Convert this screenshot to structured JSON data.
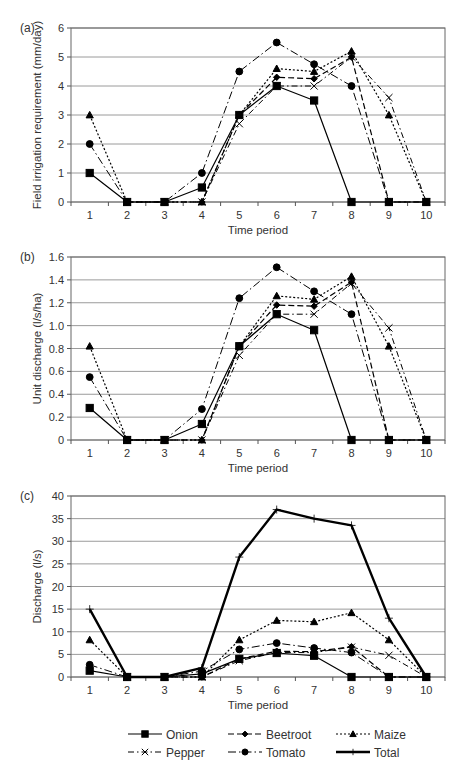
{
  "series_styles": {
    "Onion": {
      "marker": "square",
      "dash": "",
      "width": 1.2
    },
    "Beetroot": {
      "marker": "diamond",
      "dash": "6,3",
      "width": 1.2
    },
    "Maize": {
      "marker": "triangle",
      "dash": "2,2",
      "width": 1.2
    },
    "Pepper": {
      "marker": "x",
      "dash": "6,3,1.5,3",
      "width": 1.0
    },
    "Tomato": {
      "marker": "circle",
      "dash": "8,3,1.5,3",
      "width": 1.0
    },
    "Total": {
      "marker": "plus",
      "dash": "",
      "width": 2.4
    }
  },
  "legend": {
    "items": [
      "Onion",
      "Beetroot",
      "Maize",
      "Pepper",
      "Tomato",
      "Total"
    ]
  },
  "chart_data": [
    {
      "panel_label": "(a)",
      "type": "line",
      "title": "",
      "xlabel": "Time period",
      "ylabel": "Field irrigation requirement (mm/day)",
      "categories": [
        1,
        2,
        3,
        4,
        5,
        6,
        7,
        8,
        9,
        10
      ],
      "ylim": [
        0,
        6
      ],
      "yticks": [
        0,
        1,
        2,
        3,
        4,
        5,
        6
      ],
      "ytick_labels": [
        "0",
        "1",
        "2",
        "3",
        "4",
        "5",
        "6"
      ],
      "grid": true,
      "series": [
        {
          "name": "Onion",
          "values": [
            1.0,
            0,
            0,
            0.5,
            3.0,
            4.0,
            3.5,
            0,
            0,
            0
          ]
        },
        {
          "name": "Beetroot",
          "values": [
            null,
            0,
            0,
            0,
            3.0,
            4.3,
            4.25,
            5.0,
            0,
            0
          ]
        },
        {
          "name": "Maize",
          "values": [
            3.0,
            0,
            0,
            0,
            3.0,
            4.6,
            4.5,
            5.2,
            3.0,
            0
          ]
        },
        {
          "name": "Pepper",
          "values": [
            null,
            0,
            0,
            0,
            2.7,
            4.0,
            4.0,
            5.0,
            3.6,
            0
          ]
        },
        {
          "name": "Tomato",
          "values": [
            2.0,
            0,
            0,
            1.0,
            4.5,
            5.5,
            4.75,
            4.0,
            0,
            0
          ]
        }
      ],
      "frame": {
        "left": 71,
        "top": 28,
        "right": 445,
        "bottom": 202
      }
    },
    {
      "panel_label": "(b)",
      "type": "line",
      "title": "",
      "xlabel": "Time period",
      "ylabel": "Unit discharge (l/s/ha)",
      "categories": [
        1,
        2,
        3,
        4,
        5,
        6,
        7,
        8,
        9,
        10
      ],
      "ylim": [
        0,
        1.6
      ],
      "yticks": [
        0,
        0.2,
        0.4,
        0.6,
        0.8,
        1.0,
        1.2,
        1.4,
        1.6
      ],
      "ytick_labels": [
        "0",
        "0.2",
        "0.4",
        "0.6",
        "0.8",
        "1.0",
        "1.2",
        "1.4",
        "1.6"
      ],
      "grid": true,
      "series": [
        {
          "name": "Onion",
          "values": [
            0.28,
            0,
            0,
            0.14,
            0.82,
            1.1,
            0.96,
            0,
            0,
            0
          ]
        },
        {
          "name": "Beetroot",
          "values": [
            null,
            0,
            0,
            0,
            0.82,
            1.18,
            1.17,
            1.38,
            0,
            0
          ]
        },
        {
          "name": "Maize",
          "values": [
            0.82,
            0,
            0,
            0,
            0.82,
            1.26,
            1.23,
            1.43,
            0.82,
            0
          ]
        },
        {
          "name": "Pepper",
          "values": [
            null,
            0,
            0,
            0,
            0.74,
            1.1,
            1.1,
            1.37,
            0.98,
            0
          ]
        },
        {
          "name": "Tomato",
          "values": [
            0.55,
            0,
            0,
            0.27,
            1.24,
            1.51,
            1.3,
            1.1,
            0,
            0
          ]
        }
      ],
      "frame": {
        "left": 71,
        "top": 257,
        "right": 445,
        "bottom": 440
      }
    },
    {
      "panel_label": "(c)",
      "type": "line",
      "title": "",
      "xlabel": "Time period",
      "ylabel": "Discharge (l/s)",
      "categories": [
        1,
        2,
        3,
        4,
        5,
        6,
        7,
        8,
        9,
        10
      ],
      "ylim": [
        0,
        40
      ],
      "yticks": [
        0,
        5,
        10,
        15,
        20,
        25,
        30,
        35,
        40
      ],
      "ytick_labels": [
        "0",
        "5",
        "10",
        "15",
        "20",
        "25",
        "30",
        "35",
        "40"
      ],
      "grid": true,
      "legend_position": "bottom",
      "series": [
        {
          "name": "Onion",
          "values": [
            1.4,
            0,
            0,
            0.7,
            4.0,
            5.3,
            4.7,
            0,
            0,
            0
          ]
        },
        {
          "name": "Beetroot",
          "values": [
            null,
            0,
            0,
            0,
            4.0,
            5.7,
            5.6,
            6.7,
            0,
            0
          ]
        },
        {
          "name": "Maize",
          "values": [
            8.2,
            0,
            0,
            0,
            8.2,
            12.5,
            12.2,
            14.2,
            8.2,
            0
          ]
        },
        {
          "name": "Pepper",
          "values": [
            null,
            0,
            0,
            0,
            3.6,
            5.4,
            5.4,
            6.6,
            4.8,
            0
          ]
        },
        {
          "name": "Tomato",
          "values": [
            2.7,
            0,
            0,
            1.3,
            6.1,
            7.5,
            6.4,
            5.4,
            0,
            0
          ]
        },
        {
          "name": "Total",
          "values": [
            15.0,
            0,
            0,
            2.0,
            26.5,
            37.0,
            35.0,
            33.5,
            13.0,
            0
          ]
        }
      ],
      "frame": {
        "left": 71,
        "top": 496,
        "right": 445,
        "bottom": 677
      }
    }
  ]
}
